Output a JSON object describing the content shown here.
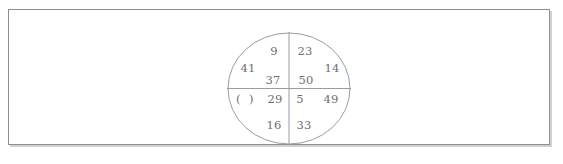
{
  "figure": {
    "type": "quadrant-circle-number-puzzle",
    "shape": "circle",
    "divider_lines": [
      "horizontal-diameter",
      "vertical-diameter"
    ],
    "stroke_color": "#9a9c9e",
    "text_color": "#6d6f71",
    "frame": {
      "border_color": "#8d8f91",
      "background": "#ffffff"
    },
    "quadrants": [
      {
        "name": "top-left",
        "inner_top": "9",
        "outer": "41",
        "inner_bottom": "37"
      },
      {
        "name": "top-right",
        "inner_top": "23",
        "outer": "14",
        "inner_bottom": "50"
      },
      {
        "name": "bottom-left",
        "inner_top": "29",
        "outer": "(  )",
        "inner_bottom": "16"
      },
      {
        "name": "bottom-right",
        "inner_top": "5",
        "outer": "49",
        "inner_bottom": "33"
      }
    ]
  }
}
